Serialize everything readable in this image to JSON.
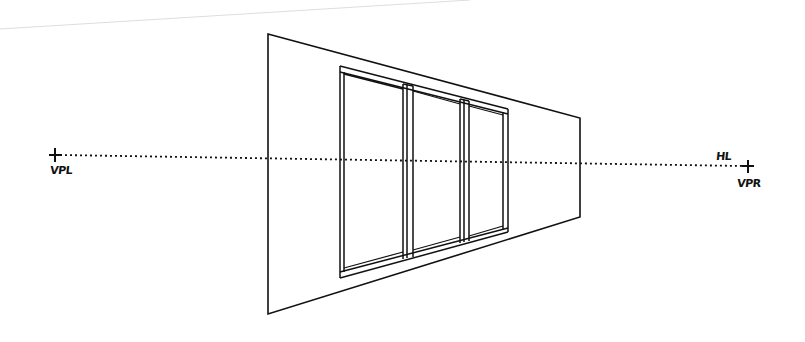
{
  "diagram": {
    "type": "two-point perspective sketch",
    "labels": {
      "vanishing_point_left": "VPL",
      "vanishing_point_right": "VPR",
      "horizon_line": "HL"
    },
    "colors": {
      "ink": "#111111",
      "background": "#ffffff",
      "faint_line": "#dddddd"
    }
  }
}
